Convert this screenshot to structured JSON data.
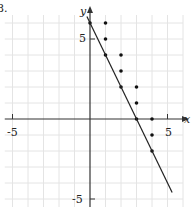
{
  "problem_label": "8.",
  "chart_data": {
    "type": "scatter",
    "title": "",
    "xlabel": "x",
    "ylabel": "y",
    "x_tick_labels": [
      "-5",
      "5"
    ],
    "y_tick_labels": [
      "5",
      "-5"
    ],
    "xlim": [
      -5.5,
      6
    ],
    "ylim": [
      -5.5,
      6.5
    ],
    "grid": true,
    "series": [
      {
        "name": "points",
        "type": "scatter",
        "points": [
          [
            0,
            6
          ],
          [
            1,
            6
          ],
          [
            1,
            5
          ],
          [
            1,
            4
          ],
          [
            2,
            4
          ],
          [
            2,
            3
          ],
          [
            2,
            2
          ],
          [
            3,
            2
          ],
          [
            3,
            1
          ],
          [
            3,
            0
          ],
          [
            4,
            0
          ],
          [
            4,
            -1
          ],
          [
            4,
            -2
          ]
        ]
      },
      {
        "name": "boundary line y = -2x + 6",
        "type": "line",
        "points": [
          [
            -0.2,
            6.4
          ],
          [
            5.3,
            -4.6
          ]
        ]
      }
    ]
  },
  "style": {
    "grid_color": "#e4e4e4",
    "axis_color": "#333333",
    "line_color": "#222222",
    "point_color": "#111111"
  }
}
